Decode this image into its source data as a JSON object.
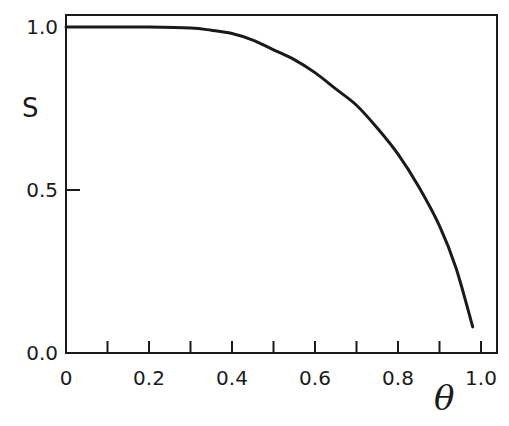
{
  "chart_data": {
    "type": "line",
    "title": "",
    "xlabel": "θ",
    "ylabel": "S",
    "xlim": [
      0,
      1.04
    ],
    "ylim": [
      0,
      1.04
    ],
    "grid": false,
    "legend": null,
    "x_ticks": [
      {
        "value": 0,
        "label": "0"
      },
      {
        "value": 0.2,
        "label": "0.2"
      },
      {
        "value": 0.4,
        "label": "0.4"
      },
      {
        "value": 0.6,
        "label": "0.6"
      },
      {
        "value": 0.8,
        "label": "0.8"
      },
      {
        "value": 1.0,
        "label": "1.0"
      }
    ],
    "x_minor_ticks": [
      0.1,
      0.3,
      0.5,
      0.7,
      0.9
    ],
    "y_ticks": [
      {
        "value": 0.0,
        "label": "0.0"
      },
      {
        "value": 0.5,
        "label": "0.5"
      },
      {
        "value": 1.0,
        "label": "1.0"
      }
    ],
    "series": [
      {
        "name": "S(θ)",
        "color": "#1a1a1a",
        "x": [
          0.0,
          0.1,
          0.2,
          0.3,
          0.35,
          0.4,
          0.45,
          0.5,
          0.55,
          0.6,
          0.65,
          0.7,
          0.75,
          0.8,
          0.85,
          0.9,
          0.94,
          0.98
        ],
        "y": [
          1.0,
          1.0,
          1.0,
          0.997,
          0.99,
          0.98,
          0.96,
          0.93,
          0.9,
          0.86,
          0.81,
          0.76,
          0.69,
          0.61,
          0.51,
          0.39,
          0.26,
          0.08
        ]
      }
    ]
  }
}
